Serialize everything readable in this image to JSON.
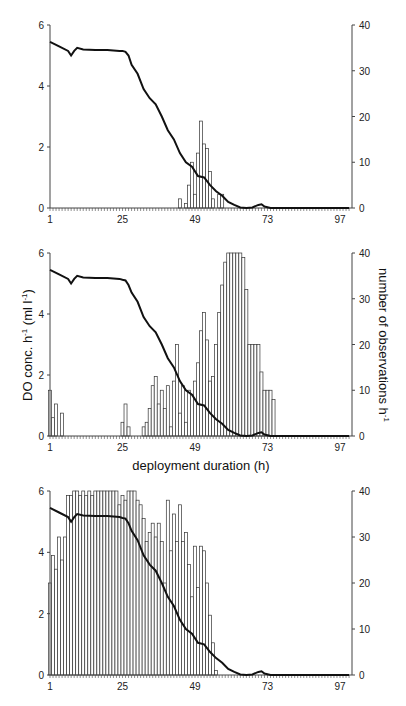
{
  "chart_data": [
    {
      "type": "bar+line",
      "panel": "top",
      "xlabel": "",
      "ylabel_left": "",
      "ylabel_right": "",
      "x_ticks": [
        1,
        25,
        49,
        73,
        97
      ],
      "ylim_left": [
        0,
        6
      ],
      "yticks_left": [
        0,
        2,
        4,
        6
      ],
      "ylim_right": [
        0,
        40
      ],
      "yticks_right": [
        0,
        10,
        20,
        30,
        40
      ],
      "bars": {
        "name": "number of observations h-1",
        "hours": [
          44,
          46,
          47,
          48,
          49,
          50,
          51,
          52,
          53,
          54,
          55,
          57,
          58
        ],
        "values": [
          2,
          1,
          5,
          10,
          3,
          12,
          19,
          14,
          13,
          8,
          2,
          3,
          3
        ]
      },
      "line": {
        "name": "DO conc. h-1",
        "hours": [
          1,
          4,
          7,
          8,
          9,
          10,
          12,
          16,
          20,
          24,
          25,
          26,
          27,
          28,
          30,
          32,
          34,
          36,
          38,
          40,
          42,
          44,
          46,
          48,
          50,
          52,
          54,
          56,
          58,
          60,
          62,
          64,
          66,
          68,
          70,
          71,
          72,
          74,
          76,
          80,
          100
        ],
        "values": [
          5.45,
          5.3,
          5.15,
          5.0,
          5.15,
          5.25,
          5.2,
          5.18,
          5.18,
          5.15,
          5.15,
          5.12,
          5.0,
          4.7,
          4.4,
          3.9,
          3.6,
          3.4,
          3.0,
          2.55,
          2.25,
          1.8,
          1.5,
          1.35,
          1.05,
          1.0,
          0.75,
          0.55,
          0.4,
          0.2,
          0.1,
          0.02,
          0.0,
          0.02,
          0.1,
          0.12,
          0.05,
          0.0,
          0.0,
          0.0,
          0.0
        ]
      }
    },
    {
      "type": "bar+line",
      "panel": "middle",
      "xlabel": "deployment duration (h)",
      "ylabel_left": "DO conc. h-1 (ml l-1)",
      "ylabel_right": "number of observations h-1",
      "x_ticks": [
        1,
        25,
        49,
        73,
        97
      ],
      "ylim_left": [
        0,
        6
      ],
      "yticks_left": [
        0,
        2,
        4,
        6
      ],
      "ylim_right": [
        0,
        40
      ],
      "yticks_right": [
        0,
        10,
        20,
        30,
        40
      ],
      "bars": {
        "name": "number of observations h-1",
        "hours": [
          1,
          2,
          3,
          5,
          25,
          26,
          27,
          32,
          33,
          34,
          35,
          36,
          37,
          38,
          39,
          40,
          41,
          42,
          43,
          44,
          45,
          46,
          47,
          48,
          49,
          50,
          51,
          52,
          53,
          54,
          55,
          56,
          57,
          58,
          59,
          60,
          61,
          62,
          63,
          64,
          65,
          66,
          67,
          68,
          69,
          70,
          71,
          72,
          73,
          74,
          75,
          76,
          77
        ],
        "values": [
          10,
          4,
          7,
          5,
          3,
          7,
          2,
          2,
          3,
          6,
          11,
          13,
          7,
          10,
          6,
          11,
          2,
          12,
          20,
          5,
          11,
          3,
          10,
          9,
          12,
          16,
          23,
          27,
          21,
          12,
          13,
          20,
          27,
          33,
          38,
          40,
          40,
          40,
          40,
          40,
          39,
          32,
          20,
          20,
          20,
          20,
          14,
          10,
          10,
          10,
          8,
          0,
          0
        ]
      },
      "line": {
        "name": "DO conc. h-1",
        "hours": [
          1,
          4,
          7,
          8,
          9,
          10,
          12,
          16,
          20,
          24,
          25,
          26,
          27,
          28,
          30,
          32,
          34,
          36,
          38,
          40,
          42,
          44,
          46,
          48,
          50,
          52,
          54,
          56,
          58,
          60,
          62,
          64,
          66,
          68,
          70,
          71,
          72,
          74,
          76,
          80,
          100
        ],
        "values": [
          5.45,
          5.3,
          5.15,
          5.0,
          5.15,
          5.25,
          5.2,
          5.18,
          5.18,
          5.15,
          5.12,
          5.1,
          4.95,
          4.7,
          4.4,
          3.9,
          3.6,
          3.4,
          3.0,
          2.55,
          2.25,
          1.8,
          1.5,
          1.35,
          1.05,
          1.0,
          0.75,
          0.55,
          0.4,
          0.2,
          0.1,
          0.02,
          0.0,
          0.02,
          0.1,
          0.12,
          0.05,
          0.0,
          0.0,
          0.0,
          0.0
        ]
      }
    },
    {
      "type": "bar+line",
      "panel": "bottom",
      "xlabel": "",
      "ylabel_left": "",
      "ylabel_right": "",
      "x_ticks": [
        1,
        25,
        49,
        73,
        97
      ],
      "ylim_left": [
        0,
        6
      ],
      "yticks_left": [
        0,
        2,
        4,
        6
      ],
      "ylim_right": [
        0,
        40
      ],
      "yticks_right": [
        0,
        10,
        20,
        30,
        40
      ],
      "bars": {
        "name": "number of observations h-1",
        "hours": [
          1,
          2,
          3,
          4,
          5,
          6,
          7,
          8,
          9,
          10,
          11,
          12,
          13,
          14,
          15,
          16,
          17,
          18,
          19,
          20,
          21,
          22,
          23,
          24,
          25,
          26,
          27,
          28,
          29,
          30,
          31,
          32,
          33,
          34,
          35,
          36,
          37,
          38,
          39,
          40,
          41,
          42,
          43,
          44,
          45,
          46,
          47,
          48,
          49,
          50,
          51,
          52,
          53,
          54,
          55,
          56,
          57
        ],
        "values": [
          20,
          26,
          23,
          30,
          25,
          30,
          39,
          39,
          40,
          40,
          39,
          40,
          39,
          40,
          39,
          40,
          40,
          40,
          40,
          40,
          40,
          40,
          40,
          37,
          39,
          38,
          40,
          40,
          40,
          38,
          37,
          34,
          29,
          31,
          33,
          30,
          33,
          29,
          20,
          38,
          27,
          35,
          29,
          37,
          29,
          31,
          24,
          17,
          28,
          19,
          28,
          27,
          20,
          13,
          7,
          1,
          0
        ]
      },
      "line": {
        "name": "DO conc. h-1",
        "hours": [
          1,
          4,
          7,
          8,
          9,
          10,
          12,
          16,
          20,
          24,
          25,
          26,
          27,
          28,
          30,
          32,
          34,
          36,
          38,
          40,
          42,
          44,
          46,
          48,
          50,
          52,
          54,
          56,
          58,
          60,
          62,
          64,
          66,
          68,
          70,
          71,
          72,
          74,
          76,
          80,
          100
        ],
        "values": [
          5.45,
          5.3,
          5.15,
          5.0,
          5.15,
          5.25,
          5.2,
          5.18,
          5.18,
          5.15,
          5.12,
          5.1,
          4.95,
          4.7,
          4.4,
          3.9,
          3.6,
          3.4,
          3.0,
          2.55,
          2.25,
          1.8,
          1.5,
          1.35,
          1.05,
          1.0,
          0.75,
          0.55,
          0.4,
          0.2,
          0.1,
          0.02,
          0.0,
          0.02,
          0.1,
          0.12,
          0.05,
          0.0,
          0.0,
          0.0,
          0.0
        ]
      }
    }
  ],
  "labels": {
    "xlabel": "deployment duration (h)",
    "ylabel_left_main": "DO conc. h",
    "ylabel_left_sup": "-1",
    "ylabel_left_unit": " (ml l",
    "ylabel_left_unit_sup": "-1",
    "ylabel_left_close": ")",
    "ylabel_right_main": "number of observations h",
    "ylabel_right_sup": "-1"
  }
}
